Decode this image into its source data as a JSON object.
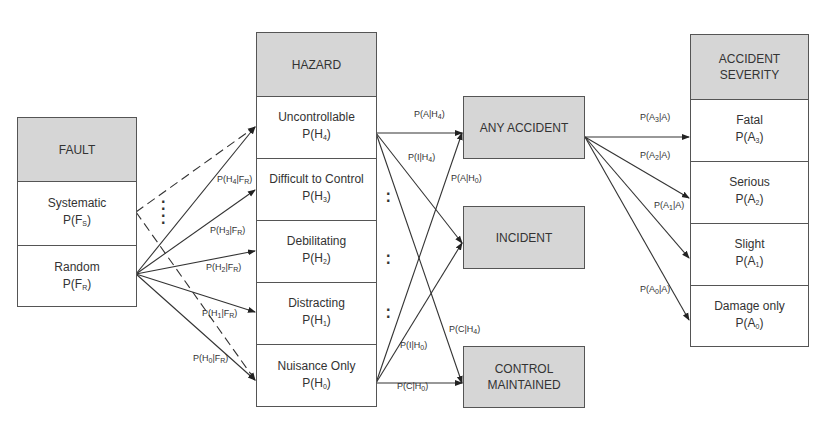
{
  "fault": {
    "header": "FAULT",
    "items": [
      {
        "name": "Systematic",
        "prob": "P(F",
        "sub": "S",
        "close": ")"
      },
      {
        "name": "Random",
        "prob": "P(F",
        "sub": "R",
        "close": ")"
      }
    ]
  },
  "hazard": {
    "header": "HAZARD",
    "items": [
      {
        "name": "Uncontrollable",
        "prob": "P(H",
        "sub": "4",
        "close": ")"
      },
      {
        "name": "Difficult to Control",
        "prob": "P(H",
        "sub": "3",
        "close": ")"
      },
      {
        "name": "Debilitating",
        "prob": "P(H",
        "sub": "2",
        "close": ")"
      },
      {
        "name": "Distracting",
        "prob": "P(H",
        "sub": "1",
        "close": ")"
      },
      {
        "name": "Nuisance Only",
        "prob": "P(H",
        "sub": "0",
        "close": ")"
      }
    ]
  },
  "outcomes": {
    "any_accident": "ANY ACCIDENT",
    "incident": "INCIDENT",
    "control_maintained": "CONTROL MAINTAINED"
  },
  "severity": {
    "header": "ACCIDENT SEVERITY",
    "items": [
      {
        "name": "Fatal",
        "prob": "P(A",
        "sub": "3",
        "close": ")"
      },
      {
        "name": "Serious",
        "prob": "P(A",
        "sub": "2",
        "close": ")"
      },
      {
        "name": "Slight",
        "prob": "P(A",
        "sub": "1",
        "close": ")"
      },
      {
        "name": "Damage only",
        "prob": "P(A",
        "sub": "0",
        "close": ")"
      }
    ]
  },
  "edge_labels": {
    "fault_to_hazard": [
      {
        "pre": "P(H",
        "sub": "4",
        "mid": "|F",
        "sub2": "R",
        "post": ")"
      },
      {
        "pre": "P(H",
        "sub": "3",
        "mid": "|F",
        "sub2": "R",
        "post": ")"
      },
      {
        "pre": "P(H",
        "sub": "2",
        "mid": "|F",
        "sub2": "R",
        "post": ")"
      },
      {
        "pre": "P(H",
        "sub": "1",
        "mid": "|F",
        "sub2": "R",
        "post": ")"
      },
      {
        "pre": "P(H",
        "sub": "0",
        "mid": "|F",
        "sub2": "R",
        "post": ")"
      }
    ],
    "hazard_to_outcome": [
      {
        "pre": "P(A|H",
        "sub": "4",
        "post": ")"
      },
      {
        "pre": "P(I|H",
        "sub": "4",
        "post": ")"
      },
      {
        "pre": "P(A|H",
        "sub": "0",
        "post": ")"
      },
      {
        "pre": "P(C|H",
        "sub": "4",
        "post": ")"
      },
      {
        "pre": "P(I|H",
        "sub": "0",
        "post": ")"
      },
      {
        "pre": "P(C|H",
        "sub": "0",
        "post": ")"
      }
    ],
    "accident_to_severity": [
      {
        "pre": "P(A",
        "sub": "3",
        "post": "|A)"
      },
      {
        "pre": "P(A",
        "sub": "2",
        "post": "|A)"
      },
      {
        "pre": "P(A",
        "sub": "1",
        "post": "|A)"
      },
      {
        "pre": "P(A",
        "sub": "0",
        "post": "|A)"
      }
    ]
  },
  "colors": {
    "header_fill": "#d6d6d6",
    "border": "#555555",
    "line": "#333333"
  }
}
